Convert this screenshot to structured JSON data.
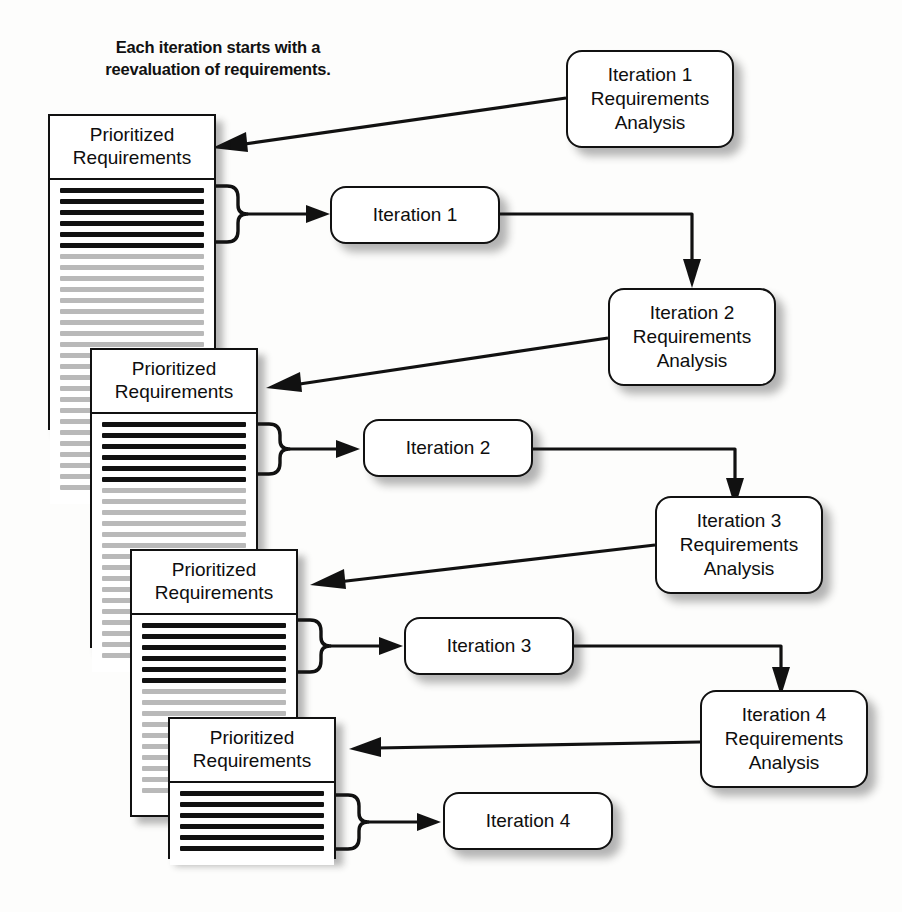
{
  "diagram": {
    "caption": "Each iteration starts with a\nreevaluation of requirements.",
    "colors": {
      "ink": "#111111",
      "paper": "#ffffff",
      "page_background": "#fdfdfc",
      "dark_line": "#111111",
      "light_line": "#b9b9b9",
      "shadow": "rgba(30,30,30,0.33)"
    },
    "documents": [
      {
        "id": "doc-1",
        "label": "Prioritized\nRequirements",
        "dark_lines": 6,
        "light_lines": 22
      },
      {
        "id": "doc-2",
        "label": "Prioritized\nRequirements",
        "dark_lines": 6,
        "light_lines": 16
      },
      {
        "id": "doc-3",
        "label": "Prioritized\nRequirements",
        "dark_lines": 6,
        "light_lines": 10
      },
      {
        "id": "doc-4",
        "label": "Prioritized\nRequirements",
        "dark_lines": 6,
        "light_lines": 0
      }
    ],
    "analysis_boxes": [
      {
        "id": "ra-1",
        "label": "Iteration 1\nRequirements\nAnalysis"
      },
      {
        "id": "ra-2",
        "label": "Iteration 2\nRequirements\nAnalysis"
      },
      {
        "id": "ra-3",
        "label": "Iteration 3\nRequirements\nAnalysis"
      },
      {
        "id": "ra-4",
        "label": "Iteration 4\nRequirements\nAnalysis"
      }
    ],
    "iteration_boxes": [
      {
        "id": "it-1",
        "label": "Iteration 1"
      },
      {
        "id": "it-2",
        "label": "Iteration 2"
      },
      {
        "id": "it-3",
        "label": "Iteration 3"
      },
      {
        "id": "it-4",
        "label": "Iteration 4"
      }
    ],
    "connectors": [
      {
        "id": "conn-ra1-doc1",
        "from": "ra-1",
        "to": "doc-1",
        "kind": "arrow-diagonal"
      },
      {
        "id": "conn-doc1-it1",
        "from": "doc-1",
        "to": "it-1",
        "kind": "brace-arrow"
      },
      {
        "id": "conn-it1-ra2",
        "from": "it-1",
        "to": "ra-2",
        "kind": "elbow-arrow"
      },
      {
        "id": "conn-ra2-doc2",
        "from": "ra-2",
        "to": "doc-2",
        "kind": "arrow-diagonal"
      },
      {
        "id": "conn-doc2-it2",
        "from": "doc-2",
        "to": "it-2",
        "kind": "brace-arrow"
      },
      {
        "id": "conn-it2-ra3",
        "from": "it-2",
        "to": "ra-3",
        "kind": "elbow-arrow"
      },
      {
        "id": "conn-ra3-doc3",
        "from": "ra-3",
        "to": "doc-3",
        "kind": "arrow-diagonal"
      },
      {
        "id": "conn-doc3-it3",
        "from": "doc-3",
        "to": "it-3",
        "kind": "brace-arrow"
      },
      {
        "id": "conn-it3-ra4",
        "from": "it-3",
        "to": "ra-4",
        "kind": "elbow-arrow"
      },
      {
        "id": "conn-ra4-doc4",
        "from": "ra-4",
        "to": "doc-4",
        "kind": "arrow-diagonal"
      },
      {
        "id": "conn-doc4-it4",
        "from": "doc-4",
        "to": "it-4",
        "kind": "brace-arrow"
      }
    ]
  }
}
